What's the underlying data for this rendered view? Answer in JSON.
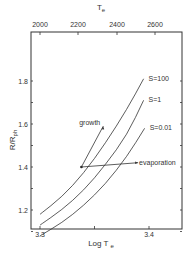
{
  "chart_data": {
    "type": "line",
    "title": "",
    "xlabel": "Log T",
    "xlabel_sub": "e",
    "ylabel": "R/R",
    "ylabel_sub": "ph",
    "top_xlabel": "T",
    "top_xlabel_sub": "e",
    "xlim": [
      3.28,
      3.43
    ],
    "ylim": [
      1.0,
      1.9
    ],
    "x_ticks": [
      3.3,
      3.4
    ],
    "x_tick_labels": [
      "3.3",
      "3.4"
    ],
    "y_ticks": [
      1.2,
      1.4,
      1.6,
      1.8
    ],
    "y_tick_labels": [
      "1.2",
      "1.4",
      "1.6",
      "1.8"
    ],
    "top_ticks": [
      2000,
      2200,
      2400,
      2600
    ],
    "top_tick_labels": [
      "2000",
      "2200",
      "2400",
      "2600"
    ],
    "grid": false,
    "legend": "inline labels",
    "series": [
      {
        "name": "S=100",
        "x": [
          3.3,
          3.32,
          3.34,
          3.36,
          3.38,
          3.395
        ],
        "y": [
          1.18,
          1.26,
          1.37,
          1.51,
          1.67,
          1.81
        ]
      },
      {
        "name": "S=1",
        "x": [
          3.3,
          3.32,
          3.34,
          3.36,
          3.38,
          3.395
        ],
        "y": [
          1.13,
          1.2,
          1.29,
          1.41,
          1.55,
          1.71
        ]
      },
      {
        "name": "S=0.01",
        "x": [
          3.3,
          3.32,
          3.34,
          3.36,
          3.38,
          3.396
        ],
        "y": [
          1.08,
          1.14,
          1.22,
          1.32,
          1.45,
          1.58
        ]
      }
    ],
    "annotations": [
      {
        "text": "growth",
        "from": [
          3.338,
          1.4
        ],
        "to": [
          3.358,
          1.59
        ]
      },
      {
        "text": "evaporation",
        "from": [
          3.338,
          1.4
        ],
        "to": [
          3.39,
          1.42
        ]
      }
    ]
  }
}
